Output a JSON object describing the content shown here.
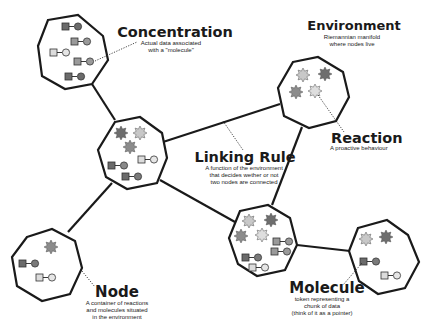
{
  "colors": {
    "stroke": "#1a1a1a",
    "dark": "#6b6b6b",
    "mid": "#9a9a9a",
    "light": "#d9d9d9",
    "reaction_dark": "#6e6e6e",
    "reaction_mid": "#8c8c8c",
    "reaction_light": "#c8c8c8"
  },
  "labels": {
    "concentration": {
      "title": "Concentration",
      "lines": [
        "Actual data associated",
        "with a \"molecule\""
      ]
    },
    "environment": {
      "title": "Environment",
      "lines": [
        "Riemannian manifold",
        "where nodes live"
      ]
    },
    "reaction": {
      "title": "Reaction",
      "lines": [
        "A proactive behaviour"
      ]
    },
    "linking_rule": {
      "title": "Linking Rule",
      "lines": [
        "A function of the environment",
        "that decides wether or not",
        "two nodes are connected"
      ]
    },
    "node": {
      "title": "Node",
      "lines": [
        "A container of reactions",
        "and molecules situated",
        "in the environment"
      ]
    },
    "molecule": {
      "title": "Molecule",
      "lines": [
        "token representing a",
        "chunk of data",
        "(think of it as a pointer)"
      ]
    }
  },
  "icons": {
    "reaction": "starburst-icon",
    "molecule": "square-arrow-circle-icon"
  },
  "nodes": [
    {
      "id": "A",
      "reactions": 0,
      "molecules": 5
    },
    {
      "id": "B",
      "reactions": 3,
      "molecules": 3
    },
    {
      "id": "C",
      "reactions": 4,
      "molecules": 0
    },
    {
      "id": "D",
      "reactions": 1,
      "molecules": 2
    },
    {
      "id": "E",
      "reactions": 4,
      "molecules": 4
    },
    {
      "id": "F",
      "reactions": 2,
      "molecules": 2
    }
  ],
  "edges": [
    [
      "A",
      "B"
    ],
    [
      "B",
      "C"
    ],
    [
      "B",
      "D"
    ],
    [
      "B",
      "E"
    ],
    [
      "C",
      "E"
    ],
    [
      "E",
      "F"
    ]
  ]
}
